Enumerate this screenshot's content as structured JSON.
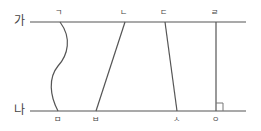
{
  "diagram": {
    "type": "parallel-lines-geometry",
    "lines": {
      "top": {
        "label": "가",
        "y": 22,
        "x1": 30,
        "x2": 246
      },
      "bottom": {
        "label": "나",
        "y": 111,
        "x1": 30,
        "x2": 246
      }
    },
    "points": {
      "top": [
        {
          "label": "ㄱ",
          "x": 60
        },
        {
          "label": "ㄴ",
          "x": 125
        },
        {
          "label": "ㄷ",
          "x": 165
        },
        {
          "label": "ㄹ",
          "x": 216
        }
      ],
      "bottom": [
        {
          "label": "ㅁ",
          "x": 58
        },
        {
          "label": "ㅂ",
          "x": 96
        },
        {
          "label": "ㅅ",
          "x": 177
        },
        {
          "label": "ㅇ",
          "x": 216
        }
      ]
    },
    "segments": [
      {
        "from": "ㄱ",
        "to": "ㅁ",
        "kind": "curve"
      },
      {
        "from": "ㄴ",
        "to": "ㅂ",
        "kind": "straight"
      },
      {
        "from": "ㄷ",
        "to": "ㅅ",
        "kind": "straight"
      },
      {
        "from": "ㄹ",
        "to": "ㅇ",
        "kind": "perpendicular"
      }
    ],
    "right_angle_marker": {
      "at": "ㅇ"
    },
    "colors": {
      "stroke": "#555555",
      "text": "#444444"
    }
  }
}
